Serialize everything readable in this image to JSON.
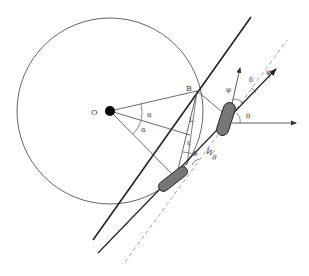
{
  "diagram": {
    "type": "geometric-vehicle-kinematics",
    "labels": {
      "center": "O",
      "point_b": "B",
      "length": "L",
      "angle_alpha_upper": "α",
      "angle_alpha_lower": "α",
      "angle_epsilon": "ε",
      "angle_alpha_small": "α",
      "width": "W",
      "width_sub": "B",
      "angle_theta": "θ",
      "angle_phi": "φ",
      "angle_delta": "δ",
      "angle_psi": "ψ"
    },
    "colors": {
      "stroke": "#222222",
      "thin_stroke": "#555555",
      "dashed": "#999999",
      "wheel_fill": "#777777",
      "dot": "#000000",
      "background": "#ffffff"
    }
  }
}
